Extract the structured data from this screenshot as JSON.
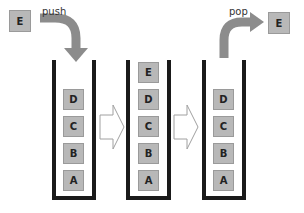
{
  "diagram": {
    "type": "stack push/pop illustration",
    "push": {
      "label": "push",
      "element": "E"
    },
    "pop": {
      "label": "pop",
      "element": "E"
    },
    "stacks": [
      {
        "name": "before",
        "items": [
          "D",
          "C",
          "B",
          "A"
        ]
      },
      {
        "name": "after-push",
        "items": [
          "E",
          "D",
          "C",
          "B",
          "A"
        ]
      },
      {
        "name": "after-pop",
        "items": [
          "D",
          "C",
          "B",
          "A"
        ]
      }
    ],
    "colors": {
      "box": "#b8b8b8",
      "wall": "#1a1a1a",
      "curved_arrow": "#8c8c8c",
      "step_arrow_outline": "#a0a0a0"
    }
  }
}
